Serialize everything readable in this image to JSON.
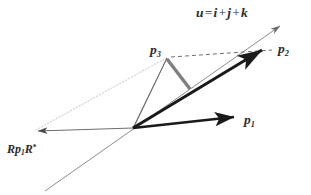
{
  "figure": {
    "background_color": "#ffffff",
    "width": 311,
    "height": 195
  },
  "labels": {
    "axis_u": {
      "name": "u-axis-label",
      "text_full": "u = i + j + k",
      "symbol": "u",
      "equals": "=",
      "term_i": "i",
      "plus_1": "+",
      "term_j": "j",
      "plus_2": "+",
      "term_k": "k"
    },
    "p1": {
      "name": "p1-label",
      "symbol": "p",
      "subscript": "1",
      "text_full": "p1"
    },
    "p2": {
      "name": "p2-label",
      "symbol": "p",
      "subscript": "2",
      "text_full": "p2"
    },
    "p3": {
      "name": "p3-label",
      "symbol": "p",
      "subscript": "3",
      "text_full": "p3"
    },
    "rotated": {
      "name": "rotated-vector-label",
      "prefix": "R",
      "symbol": "p",
      "subscript": "1",
      "suffix": "R",
      "star": "*",
      "text_full": "Rp1R*"
    }
  },
  "colors": {
    "vector_dark": "#1a1a1a",
    "thin_line": "#6e6e6e",
    "dotted_line": "#bdbdbd",
    "dashed_line": "#707070",
    "perpendicular_gray": "#808080",
    "text": "#2b2b2b",
    "background": "#ffffff"
  },
  "geometry": {
    "origin": {
      "x": 133,
      "y": 128
    },
    "vectors": [
      {
        "name": "vector-p1",
        "style": "thick-solid-arrow",
        "color": "#1a1a1a",
        "width": 2.6,
        "from": {
          "x": 133,
          "y": 128
        },
        "to": {
          "x": 238,
          "y": 117
        }
      },
      {
        "name": "vector-p2",
        "style": "thick-solid-arrow",
        "color": "#1a1a1a",
        "width": 3.0,
        "from": {
          "x": 133,
          "y": 128
        },
        "to": {
          "x": 265,
          "y": 48
        }
      },
      {
        "name": "vector-rotated-p1",
        "style": "thin-solid-arrow",
        "color": "#6e6e6e",
        "width": 1.0,
        "from": {
          "x": 133,
          "y": 128
        },
        "to": {
          "x": 34,
          "y": 131
        }
      },
      {
        "name": "axis-u-line",
        "style": "thin-solid-arrow",
        "color": "#8a8a8a",
        "width": 1.0,
        "from": {
          "x": 45,
          "y": 191
        },
        "to": {
          "x": 283,
          "y": 24
        }
      }
    ],
    "segments": [
      {
        "name": "segment-origin-to-p3",
        "style": "thin-solid",
        "color": "#6e6e6e",
        "width": 1.0,
        "from": {
          "x": 133,
          "y": 128
        },
        "to": {
          "x": 167,
          "y": 58
        }
      },
      {
        "name": "segment-p3-perpendicular-to-p2",
        "style": "thick-solid",
        "color": "#808080",
        "width": 3.4,
        "from": {
          "x": 167,
          "y": 59
        },
        "to": {
          "x": 190,
          "y": 89
        }
      },
      {
        "name": "segment-p3-to-p2-dashed",
        "style": "dashed",
        "color": "#707070",
        "width": 1.0,
        "from": {
          "x": 170,
          "y": 57
        },
        "to": {
          "x": 272,
          "y": 50
        }
      },
      {
        "name": "segment-rotated-to-p3-dotted",
        "style": "dotted",
        "color": "#bdbdbd",
        "width": 1.0,
        "from": {
          "x": 36,
          "y": 130
        },
        "to": {
          "x": 166,
          "y": 58
        }
      }
    ]
  }
}
